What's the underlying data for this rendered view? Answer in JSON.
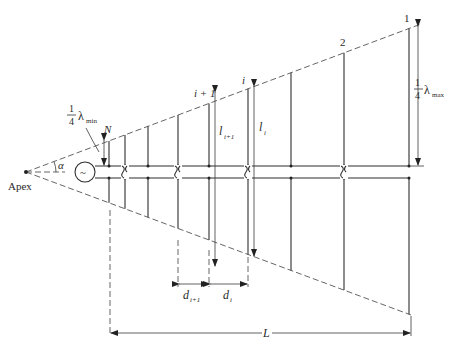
{
  "diagram": {
    "labels": {
      "apex": "Apex",
      "alpha": "α",
      "n_element": "N",
      "element_1": "1",
      "element_2": "2",
      "element_i": "i",
      "element_i_plus_1": "i + 1",
      "l_i": "l",
      "l_i_sub": "i",
      "l_i1": "l",
      "l_i1_sub": "i+1",
      "d_i": "d",
      "d_i_sub": "i",
      "d_i1": "d",
      "d_i1_sub": "i+1",
      "total_length": "L",
      "quarter_num": "1",
      "quarter_den": "4",
      "lambda": "λ",
      "lambda_min_sub": "min",
      "lambda_max_sub": "max",
      "source_symbol": "~"
    },
    "elements": [
      {
        "id": "N",
        "crossover": false
      },
      {
        "id": "N-1",
        "crossover": true
      },
      {
        "id": "N-2",
        "crossover": false
      },
      {
        "id": "N-3",
        "crossover": true
      },
      {
        "id": "i+1",
        "crossover": false
      },
      {
        "id": "i",
        "crossover": true
      },
      {
        "id": "4",
        "crossover": false
      },
      {
        "id": "2",
        "crossover": true
      },
      {
        "id": "1",
        "crossover": false
      }
    ],
    "caption": ""
  }
}
